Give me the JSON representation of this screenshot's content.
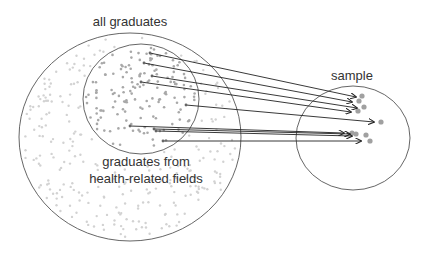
{
  "labels": {
    "population": "all graduates",
    "subpopulation_line1": "graduates from",
    "subpopulation_line2": "health-related fields",
    "sample": "sample"
  },
  "colors": {
    "outline": "#555555",
    "arrow": "#222222",
    "population_dot": "#d2d2d2",
    "subpopulation_dot": "#a8a8a8",
    "sample_dot": "#a0a0a0",
    "text": "#333333"
  },
  "shapes": {
    "population_circle": {
      "cx": 130,
      "cy": 137,
      "rx": 111,
      "ry": 104
    },
    "subpopulation_circle": {
      "cx": 141,
      "cy": 99,
      "rx": 58,
      "ry": 55
    },
    "sample_circle": {
      "cx": 353,
      "cy": 138,
      "rx": 57,
      "ry": 52
    }
  },
  "arrows": [
    {
      "x1": 150,
      "y1": 53,
      "x2": 356,
      "y2": 97
    },
    {
      "x1": 144,
      "y1": 63,
      "x2": 352,
      "y2": 102
    },
    {
      "x1": 152,
      "y1": 76,
      "x2": 357,
      "y2": 108
    },
    {
      "x1": 141,
      "y1": 82,
      "x2": 351,
      "y2": 112
    },
    {
      "x1": 186,
      "y1": 105,
      "x2": 374,
      "y2": 122
    },
    {
      "x1": 130,
      "y1": 126,
      "x2": 344,
      "y2": 133
    },
    {
      "x1": 154,
      "y1": 129,
      "x2": 350,
      "y2": 134
    },
    {
      "x1": 156,
      "y1": 131,
      "x2": 352,
      "y2": 136
    },
    {
      "x1": 163,
      "y1": 141,
      "x2": 361,
      "y2": 141
    }
  ],
  "sample_points": [
    {
      "x": 362,
      "y": 96
    },
    {
      "x": 359,
      "y": 101
    },
    {
      "x": 364,
      "y": 107
    },
    {
      "x": 358,
      "y": 111
    },
    {
      "x": 381,
      "y": 122
    },
    {
      "x": 352,
      "y": 133
    },
    {
      "x": 356,
      "y": 134
    },
    {
      "x": 366,
      "y": 135
    },
    {
      "x": 370,
      "y": 141
    }
  ]
}
